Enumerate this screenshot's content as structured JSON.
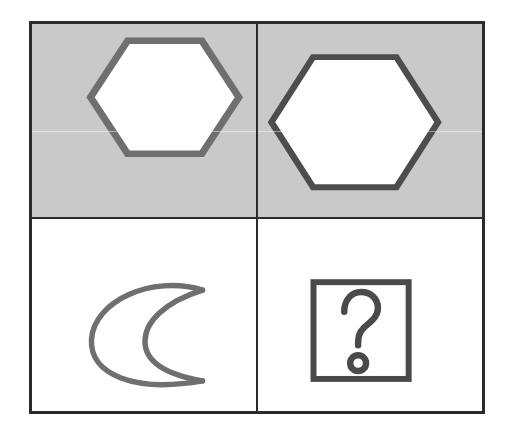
{
  "puzzle": {
    "type": "visual-analogy-matrix",
    "title": "Hexagon size analogy with crescent",
    "rows": 2,
    "columns": 2,
    "colors": {
      "frame_stroke": "#2b2b2b",
      "shaded_cell_background": "#c9c9c9",
      "plain_cell_background": "#ffffff",
      "shape_stroke": "#6f6f6f",
      "answer_box_stroke": "#4a4a4a",
      "question_mark_stroke": "#4a4a4a",
      "shape_fill": "#ffffff"
    },
    "cells": [
      {
        "position": "top-left",
        "background": "shaded",
        "shape": "hexagon",
        "shape_label": "small hexagon",
        "orientation": "pointy-left-right",
        "relative_size": "small",
        "fill": "white",
        "stroke_width": 7
      },
      {
        "position": "top-right",
        "background": "shaded",
        "shape": "hexagon",
        "shape_label": "large hexagon",
        "orientation": "pointy-left-right",
        "relative_size": "large",
        "fill": "white",
        "stroke_width": 7
      },
      {
        "position": "bottom-left",
        "background": "plain",
        "shape": "crescent",
        "shape_label": "small crescent outline",
        "orientation": "opening-left",
        "relative_size": "small",
        "fill": "none",
        "stroke_width": 5
      },
      {
        "position": "bottom-right",
        "background": "plain",
        "shape": "answer-placeholder",
        "shape_label": "question mark in square box",
        "glyph": "?",
        "relative_size": "unknown",
        "fill": "none",
        "stroke_width": 6
      }
    ]
  },
  "geometry": {
    "grid_left": 29,
    "grid_top": 21,
    "grid_width": 456,
    "grid_height": 393,
    "divider_x": 257,
    "divider_y": 222
  }
}
